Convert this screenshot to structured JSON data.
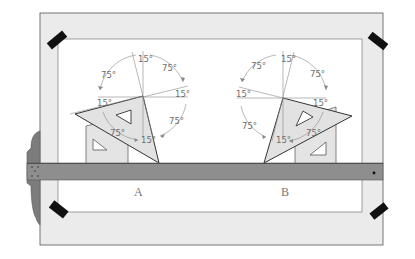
{
  "figure": {
    "type": "drafting-board-illustration"
  },
  "labels": {
    "left_figure": "A",
    "right_figure": "B"
  },
  "angles": {
    "left": {
      "top": "15°",
      "upper_left": "75°",
      "upper_right": "75°",
      "right": "15°",
      "left": "15°",
      "lower_right": "75°",
      "lower_left": "75°",
      "bottom": "15°"
    },
    "right": {
      "top": "15°",
      "upper_left": "75°",
      "upper_right": "75°",
      "left": "15°",
      "right": "15°",
      "lower_left": "75°",
      "lower_right": "75°",
      "bottom": "15°"
    }
  },
  "colors": {
    "board_border": "#e9e9e9",
    "board_line": "#555555",
    "tsquare_blade": "#8c8c8c",
    "tsquare_head": "#7a7a7a",
    "triangle_fill": "#e2e2e2",
    "tape": "#111111",
    "construction_line": "#8a8a8a",
    "angle_text": "#6e6e6e"
  }
}
